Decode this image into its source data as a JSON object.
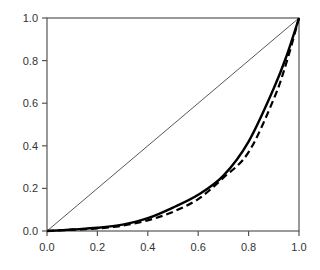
{
  "chart_data": {
    "type": "line",
    "title": "",
    "xlabel": "",
    "ylabel": "",
    "xlim": [
      0.0,
      1.0
    ],
    "ylim": [
      0.0,
      1.0
    ],
    "grid": false,
    "legend": null,
    "x_ticks": [
      "0.0",
      "0.2",
      "0.4",
      "0.6",
      "0.8",
      "1.0"
    ],
    "y_ticks": [
      "0.0",
      "0.2",
      "0.4",
      "0.6",
      "0.8",
      "1.0"
    ],
    "x": [
      0.0,
      0.1,
      0.2,
      0.3,
      0.4,
      0.5,
      0.6,
      0.7,
      0.8,
      0.9,
      0.95,
      1.0
    ],
    "series": [
      {
        "name": "equality line",
        "style": "thin-solid",
        "x": [
          0.0,
          1.0
        ],
        "values": [
          0.0,
          1.0
        ]
      },
      {
        "name": "solid curve",
        "style": "thick-solid",
        "values": [
          0.0,
          0.007,
          0.015,
          0.03,
          0.06,
          0.11,
          0.17,
          0.26,
          0.42,
          0.67,
          0.82,
          1.0
        ]
      },
      {
        "name": "dashed curve",
        "style": "thick-dashed",
        "values": [
          0.0,
          0.006,
          0.012,
          0.025,
          0.05,
          0.09,
          0.15,
          0.25,
          0.37,
          0.62,
          0.79,
          1.0
        ]
      }
    ]
  },
  "colors": {
    "axis": "#555555",
    "line": "#000000",
    "diagonal": "#444444"
  }
}
